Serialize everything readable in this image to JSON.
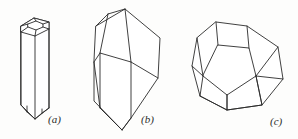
{
  "figure": {
    "width": 298,
    "height": 139,
    "background_color": "#fdfdfc",
    "line_color": "#2b2b2b",
    "face_color": "#ffffff",
    "caption_style": "italic-parenthesized-letter"
  },
  "panels": [
    {
      "id": "panel-a",
      "label": "(a)",
      "label_x": 48,
      "label_y": 114,
      "shape": "hexagonal-prism",
      "description": "hexagonal prism with shallow faceted terminations top and bottom"
    },
    {
      "id": "panel-b",
      "label": "(b)",
      "label_x": 141,
      "label_y": 114,
      "shape": "monoclinic-prism",
      "description": "monoclinic prism with oblique roof termination above and wedge point below"
    },
    {
      "id": "panel-c",
      "label": "(c)",
      "label_x": 270,
      "label_y": 116,
      "shape": "pentagonal-dodecahedron",
      "description": "pentagonal dodecahedron in general orientation"
    }
  ],
  "geometry": {
    "panel_a": {
      "top_outer_hex": "21,26 34,18 49,22 49,29 35,36 21,32",
      "top_inner_hex": "28,24 36,21 43,24 43,27 36,30 28,27",
      "top_spokes": [
        "21,26 28,24",
        "34,18 36,21",
        "49,22 43,24",
        "49,29 43,27",
        "35,36 36,30",
        "21,32 28,27"
      ],
      "body_left": "21,26 21,105",
      "body_mid": "35,36 35,115",
      "body_right": "49,29 49,108",
      "body_outline": "21,26 34,18 49,22 49,108 35,119 21,105",
      "bottom_facets": [
        "21,105 28,113 35,119",
        "49,108 42,114 35,119",
        "28,113 28,108",
        "42,114 42,111"
      ]
    },
    "panel_b": {
      "outline": "94,62 96,26 125,9 160,38 158,78 131,118 122,130 100,108",
      "top_roof": "96,26 125,9 160,38",
      "ridge_front": "125,9 131,62",
      "ridge_left": "96,26 94,62",
      "left_face_edge": "108,14 100,54",
      "apex_to_front": "125,9 108,14",
      "waist": "94,62 131,62 158,78",
      "front_vertical_left": "94,62 100,108",
      "front_vertical_mid": "131,62 131,118",
      "bottom_wedge_left": "100,108 122,130",
      "bottom_wedge_right": "131,118 122,130",
      "back_right_edge": "160,38 158,78 131,118"
    },
    "panel_c": {
      "outer": "216,22 247,26 278,47 283,79 262,105 227,110 200,96 192,66 197,38",
      "center_pentagon": "218,45 249,48 256,76 227,95 203,76",
      "upper_left_face": "216,22 197,38 203,76 218,45",
      "upper_right_face": "247,26 278,47 256,76 249,48",
      "spokes": [
        "216,22 218,45",
        "247,26 249,48",
        "197,38 203,76",
        "278,47 256,76",
        "227,95 227,110",
        "203,76 200,96",
        "256,76 262,105"
      ],
      "lower_left_face": "200,96 227,110 227,95 203,76",
      "lower_right_face": "227,110 262,105 256,76 227,95"
    }
  }
}
